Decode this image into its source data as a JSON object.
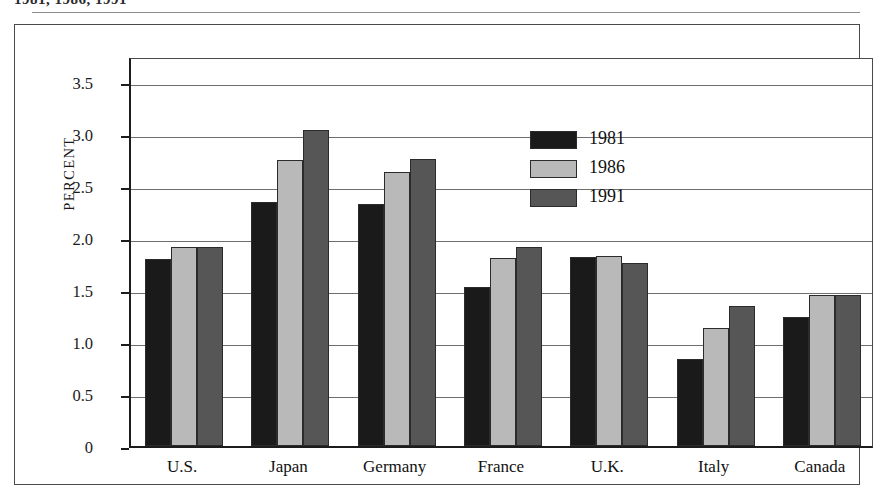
{
  "caption": {
    "text": "1981, 1986, 1991"
  },
  "chart_data": {
    "type": "bar",
    "title": "1981, 1986, 1991",
    "xlabel": "",
    "ylabel": "PERCENT",
    "ylim": [
      0,
      3.75
    ],
    "grid": true,
    "legend_position": "top-center",
    "categories": [
      "U.S.",
      "Japan",
      "Germany",
      "France",
      "U.K.",
      "Italy",
      "Canada"
    ],
    "yticks": [
      "0",
      "0.5",
      "1.0",
      "1.5",
      "2.0",
      "2.5",
      "3.0",
      "3.5"
    ],
    "ytick_values": [
      0,
      0.5,
      1.0,
      1.5,
      2.0,
      2.5,
      3.0,
      3.5
    ],
    "series": [
      {
        "name": "1981",
        "color": "#1a1a1a",
        "values": [
          1.8,
          2.35,
          2.33,
          1.53,
          1.82,
          0.84,
          1.24
        ]
      },
      {
        "name": "1986",
        "color": "#b9b9b9",
        "values": [
          1.91,
          2.75,
          2.63,
          1.81,
          1.83,
          1.13,
          1.45
        ]
      },
      {
        "name": "1991",
        "color": "#565656",
        "values": [
          1.91,
          3.04,
          2.76,
          1.91,
          1.76,
          1.35,
          1.45
        ]
      }
    ]
  }
}
